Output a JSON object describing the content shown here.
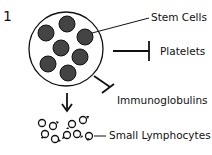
{
  "figure": {
    "panel_number": "1",
    "labels": {
      "stem_cells": "Stem Cells",
      "platelets": "Platelets",
      "immunoglobulins": "Immunoglobulins",
      "small_lymphocytes": "Small Lymphocytes"
    },
    "colors": {
      "cell_fill": "#444444",
      "stroke": "#111111"
    }
  }
}
